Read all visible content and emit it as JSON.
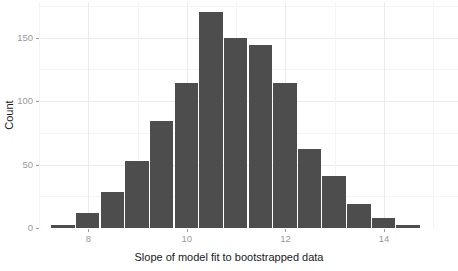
{
  "chart_data": {
    "type": "bar",
    "title": "",
    "subtitle": "",
    "xlabel": "Slope of model fit to bootstrapped data",
    "ylabel": "Count",
    "xlim": [
      7.0,
      15.5
    ],
    "ylim": [
      0,
      178
    ],
    "grid": true,
    "legend": null,
    "bin_width": 0.5,
    "bar_color": "#4d4d4d",
    "x_ticks": [
      {
        "value": 8,
        "label": "8"
      },
      {
        "value": 10,
        "label": "10"
      },
      {
        "value": 12,
        "label": "12"
      },
      {
        "value": 14,
        "label": "14"
      }
    ],
    "y_ticks": [
      {
        "value": 0,
        "label": "0"
      },
      {
        "value": 50,
        "label": "50"
      },
      {
        "value": 100,
        "label": "100"
      },
      {
        "value": 150,
        "label": "150"
      },
      {
        "value": 200,
        "label": "200"
      }
    ],
    "categories": [
      "7.25-7.75",
      "7.75-8.25",
      "8.25-8.75",
      "8.75-9.25",
      "9.25-9.75",
      "9.75-10.25",
      "10.25-10.75",
      "10.75-11.25",
      "11.25-11.75",
      "11.75-12.25",
      "12.25-12.75",
      "12.75-13.25",
      "13.25-13.75",
      "13.75-14.25",
      "14.25-14.75"
    ],
    "bin_centers": [
      7.5,
      8.0,
      8.5,
      9.0,
      9.5,
      10.0,
      10.5,
      11.0,
      11.5,
      12.0,
      12.5,
      13.0,
      13.5,
      14.0,
      14.5
    ],
    "values": [
      2,
      12,
      28,
      53,
      84,
      114,
      170,
      150,
      144,
      114,
      62,
      41,
      19,
      8,
      2
    ]
  }
}
